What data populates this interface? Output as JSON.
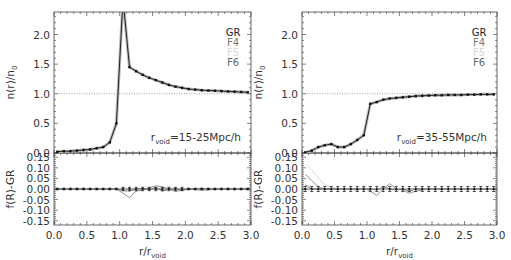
{
  "chart_data": [
    {
      "type": "line",
      "panel": "left",
      "annotation": {
        "prefix": "r",
        "sub": "void",
        "text": "=15-25Mpc/h"
      },
      "legend": [
        {
          "label": "GR",
          "color": "#222222"
        },
        {
          "label": "F4",
          "color": "#777777"
        },
        {
          "label": "F5",
          "color": "#d8d8d8"
        },
        {
          "label": "F6",
          "color": "#666666"
        }
      ],
      "top": {
        "ylabel": "n(r)/n0",
        "ylim": [
          0,
          2.38
        ],
        "yticks": [
          "0.0",
          "0.5",
          "1.0",
          "1.5",
          "2.0"
        ],
        "yvals": [
          0,
          0.5,
          1.0,
          1.5,
          2.0
        ],
        "hline": 1.0,
        "x": [
          0.05,
          0.15,
          0.25,
          0.35,
          0.45,
          0.55,
          0.65,
          0.75,
          0.85,
          0.95,
          1.05,
          1.15,
          1.25,
          1.35,
          1.45,
          1.55,
          1.65,
          1.75,
          1.85,
          1.95,
          2.05,
          2.15,
          2.25,
          2.35,
          2.45,
          2.55,
          2.65,
          2.75,
          2.85,
          2.95
        ],
        "series": [
          {
            "name": "GR",
            "values": [
              0.02,
              0.03,
              0.03,
              0.04,
              0.05,
              0.06,
              0.08,
              0.1,
              0.18,
              0.5,
              2.6,
              1.45,
              1.38,
              1.32,
              1.27,
              1.23,
              1.19,
              1.15,
              1.12,
              1.1,
              1.08,
              1.07,
              1.06,
              1.055,
              1.05,
              1.045,
              1.04,
              1.035,
              1.03,
              1.025
            ]
          }
        ]
      },
      "bottom": {
        "ylabel": "f(R)-GR",
        "ylim": [
          -0.17,
          0.17
        ],
        "yticks": [
          "0.15",
          "0.10",
          "0.05",
          "0.00",
          "-0.05",
          "-0.10",
          "-0.15"
        ],
        "yvals": [
          0.15,
          0.1,
          0.05,
          0.0,
          -0.05,
          -0.1,
          -0.15
        ],
        "xlabel": "r/rvoid",
        "xticks": [
          "0.0",
          "0.5",
          "1.0",
          "1.5",
          "2.0",
          "2.5",
          "3.0"
        ],
        "xvals": [
          0,
          0.5,
          1.0,
          1.5,
          2.0,
          2.5,
          3.0
        ],
        "x": [
          0.05,
          0.15,
          0.25,
          0.35,
          0.45,
          0.55,
          0.65,
          0.75,
          0.85,
          0.95,
          1.05,
          1.15,
          1.25,
          1.35,
          1.45,
          1.55,
          1.65,
          1.75,
          1.85,
          1.95,
          2.05,
          2.15,
          2.25,
          2.35,
          2.45,
          2.55,
          2.65,
          2.75,
          2.85,
          2.95
        ],
        "series": [
          {
            "name": "F4",
            "values": [
              0.0,
              0.0,
              0.0,
              0.0,
              0.0,
              0.0,
              0.0,
              0.0,
              0.0,
              0.0,
              -0.02,
              -0.04,
              -0.01,
              -0.005,
              0.005,
              0.015,
              0.01,
              0.0,
              -0.012,
              -0.005,
              0.0,
              -0.003,
              -0.006,
              -0.004,
              0.0,
              0.0,
              0.0,
              -0.002,
              0.0,
              0.0
            ]
          },
          {
            "name": "F6",
            "values": [
              0.0,
              0.0,
              0.0,
              0.0,
              0.0,
              0.0,
              0.0,
              0.0,
              0.0,
              0.0,
              -0.008,
              -0.01,
              -0.002,
              0.005,
              -0.005,
              0.008,
              -0.01,
              -0.003,
              0.002,
              -0.006,
              0.0,
              0.0,
              0.003,
              0.0,
              0.0,
              0.0,
              0.0,
              0.0,
              0.0,
              0.0
            ]
          }
        ],
        "errorbars": 0.008,
        "errorbar_range": [
          1.0,
          2.0
        ]
      }
    },
    {
      "type": "line",
      "panel": "right",
      "annotation": {
        "prefix": "r",
        "sub": "void",
        "text": "=35-55Mpc/h"
      },
      "legend": [
        {
          "label": "GR",
          "color": "#222222"
        },
        {
          "label": "F4",
          "color": "#777777"
        },
        {
          "label": "F5",
          "color": "#d8d8d8"
        },
        {
          "label": "F6",
          "color": "#666666"
        }
      ],
      "top": {
        "ylabel": "n(r)/n0",
        "ylim": [
          0,
          2.38
        ],
        "yticks": [
          "0.0",
          "0.5",
          "1.0",
          "1.5",
          "2.0"
        ],
        "yvals": [
          0,
          0.5,
          1.0,
          1.5,
          2.0
        ],
        "hline": 1.0,
        "x": [
          0.05,
          0.15,
          0.25,
          0.35,
          0.45,
          0.55,
          0.65,
          0.75,
          0.85,
          0.95,
          1.05,
          1.15,
          1.25,
          1.35,
          1.45,
          1.55,
          1.65,
          1.75,
          1.85,
          1.95,
          2.05,
          2.15,
          2.25,
          2.35,
          2.45,
          2.55,
          2.65,
          2.75,
          2.85,
          2.95
        ],
        "series": [
          {
            "name": "GR",
            "values": [
              0.01,
              0.04,
              0.1,
              0.13,
              0.15,
              0.1,
              0.1,
              0.15,
              0.22,
              0.3,
              0.83,
              0.86,
              0.9,
              0.92,
              0.93,
              0.94,
              0.95,
              0.96,
              0.965,
              0.97,
              0.975,
              0.975,
              0.98,
              0.98,
              0.98,
              0.985,
              0.985,
              0.99,
              0.99,
              0.99
            ]
          }
        ]
      },
      "bottom": {
        "ylabel": "f(R)-GR",
        "ylim": [
          -0.17,
          0.17
        ],
        "yticks": [
          "0.15",
          "0.10",
          "0.05",
          "0.00",
          "-0.05",
          "-0.10",
          "-0.15"
        ],
        "yvals": [
          0.15,
          0.1,
          0.05,
          0.0,
          -0.05,
          -0.1,
          -0.15
        ],
        "xlabel": "r/rvoid",
        "xticks": [
          "0.0",
          "0.5",
          "1.0",
          "1.5",
          "2.0",
          "2.5",
          "3.0"
        ],
        "xvals": [
          0,
          0.5,
          1.0,
          1.5,
          2.0,
          2.5,
          3.0
        ],
        "x": [
          0.05,
          0.15,
          0.25,
          0.35,
          0.45,
          0.55,
          0.65,
          0.75,
          0.85,
          0.95,
          1.05,
          1.15,
          1.25,
          1.35,
          1.45,
          1.55,
          1.65,
          1.75,
          1.85,
          1.95,
          2.05,
          2.15,
          2.25,
          2.35,
          2.45,
          2.55,
          2.65,
          2.75,
          2.85,
          2.95
        ],
        "series": [
          {
            "name": "F4",
            "values": [
              0.07,
              0.04,
              0.01,
              0.0,
              0.0,
              0.0,
              0.0,
              0.0,
              -0.005,
              0.005,
              -0.01,
              -0.03,
              0.0,
              0.025,
              0.0,
              -0.005,
              -0.02,
              -0.01,
              -0.005,
              0.0,
              0.0,
              -0.003,
              0.0,
              0.0,
              0.0,
              0.0,
              0.0,
              0.0,
              0.0,
              0.0
            ]
          },
          {
            "name": "F5",
            "values": [
              0.12,
              0.09,
              0.05,
              0.02,
              0.01,
              0.0,
              0.0,
              0.0,
              0.0,
              0.0,
              0.0,
              0.0,
              0.0,
              0.0,
              0.0,
              0.0,
              0.0,
              0.0,
              0.0,
              0.0,
              0.0,
              0.0,
              0.0,
              0.0,
              0.0,
              0.0,
              0.0,
              0.0,
              0.0,
              0.0
            ]
          },
          {
            "name": "F6",
            "values": [
              0.02,
              0.0,
              0.0,
              0.0,
              0.0,
              0.0,
              0.0,
              0.0,
              0.0,
              0.0,
              0.0,
              -0.005,
              0.01,
              0.0,
              -0.005,
              0.0,
              -0.01,
              0.0,
              0.0,
              0.0,
              0.0,
              0.0,
              0.0,
              0.0,
              0.0,
              0.0,
              0.0,
              0.0,
              0.0,
              0.0
            ]
          }
        ],
        "errorbars": 0.012,
        "errorbar_range": [
          0.0,
          3.0
        ]
      }
    }
  ],
  "axis_text": {
    "top_ylabel_main": "n(r)/n",
    "top_ylabel_sub": "0",
    "bottom_ylabel": "f(R)-GR",
    "xlabel_main": "r/r",
    "xlabel_sub": "void"
  }
}
